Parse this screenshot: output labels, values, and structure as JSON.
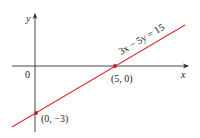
{
  "diagram": {
    "equation_label": "3x − 5y = 15",
    "x_axis_label": "x",
    "y_axis_label": "y",
    "origin_label": "0",
    "points": [
      {
        "label": "(5, 0)"
      },
      {
        "label": "(0, −3)"
      }
    ],
    "colors": {
      "line": "#d9303a",
      "axis": "#333333",
      "background": "#ffffff"
    }
  }
}
